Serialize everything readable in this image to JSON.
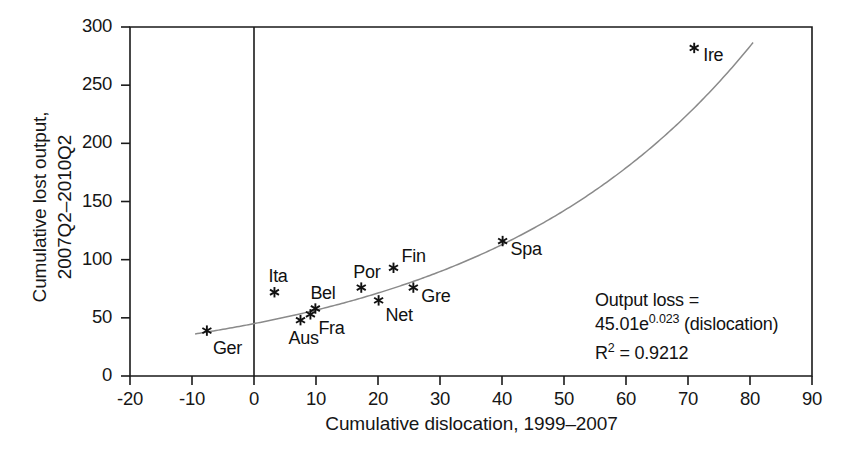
{
  "chart_data": {
    "type": "scatter",
    "title": "",
    "xlabel": "Cumulative dislocation, 1999–2007",
    "ylabel": "Cumulative lost output,\n2007Q2–2010Q2",
    "xlim": [
      -20,
      90
    ],
    "ylim": [
      0,
      300
    ],
    "xticks": [
      "-20",
      "-10",
      "0",
      "10",
      "20",
      "30",
      "40",
      "50",
      "60",
      "70",
      "80",
      "90"
    ],
    "xtick_values": [
      -20,
      -10,
      0,
      10,
      20,
      30,
      40,
      50,
      60,
      70,
      80,
      90
    ],
    "yticks": [
      "0",
      "50",
      "100",
      "150",
      "200",
      "250",
      "300"
    ],
    "ytick_values": [
      0,
      50,
      100,
      150,
      200,
      250,
      300
    ],
    "grid": false,
    "legend": "none",
    "marker": "asterisk",
    "points": [
      {
        "label": "Ger",
        "x": -7.6,
        "y": 39,
        "label_dx": 6,
        "label_dy": 7
      },
      {
        "label": "Ita",
        "x": 3.3,
        "y": 72,
        "label_dx": -6,
        "label_dy": -26
      },
      {
        "label": "Aus",
        "x": 7.5,
        "y": 48,
        "label_dx": -12,
        "label_dy": 8
      },
      {
        "label": "Fra",
        "x": 9.1,
        "y": 53,
        "label_dx": 8,
        "label_dy": 4
      },
      {
        "label": "Bel",
        "x": 9.9,
        "y": 58,
        "label_dx": -5,
        "label_dy": -26
      },
      {
        "label": "Por",
        "x": 17.3,
        "y": 76,
        "label_dx": -8,
        "label_dy": -26
      },
      {
        "label": "Net",
        "x": 20.1,
        "y": 65,
        "label_dx": 7,
        "label_dy": 5
      },
      {
        "label": "Fin",
        "x": 22.5,
        "y": 93,
        "label_dx": 8,
        "label_dy": -22
      },
      {
        "label": "Gre",
        "x": 25.7,
        "y": 76,
        "label_dx": 8,
        "label_dy": -2
      },
      {
        "label": "Spa",
        "x": 40.1,
        "y": 116,
        "label_dx": 8,
        "label_dy": -2
      },
      {
        "label": "Ire",
        "x": 71.0,
        "y": 282,
        "label_dx": 9,
        "label_dy": -3
      }
    ],
    "fit_curve": {
      "form": "exponential",
      "a": 45.01,
      "b": 0.023,
      "x_start": -9.5,
      "x_end": 80.5,
      "color": "#8a8a8a"
    },
    "annotation": {
      "line1": "Output loss =",
      "line2_base": "45.01e",
      "line2_exponent": "0.023",
      "line2_tail": " (dislocation)",
      "line3_base": "R",
      "line3_exponent": "2",
      "line3_tail": " = 0.9212"
    },
    "axis_color": "#1a1a1a",
    "marker_color": "#111111"
  }
}
